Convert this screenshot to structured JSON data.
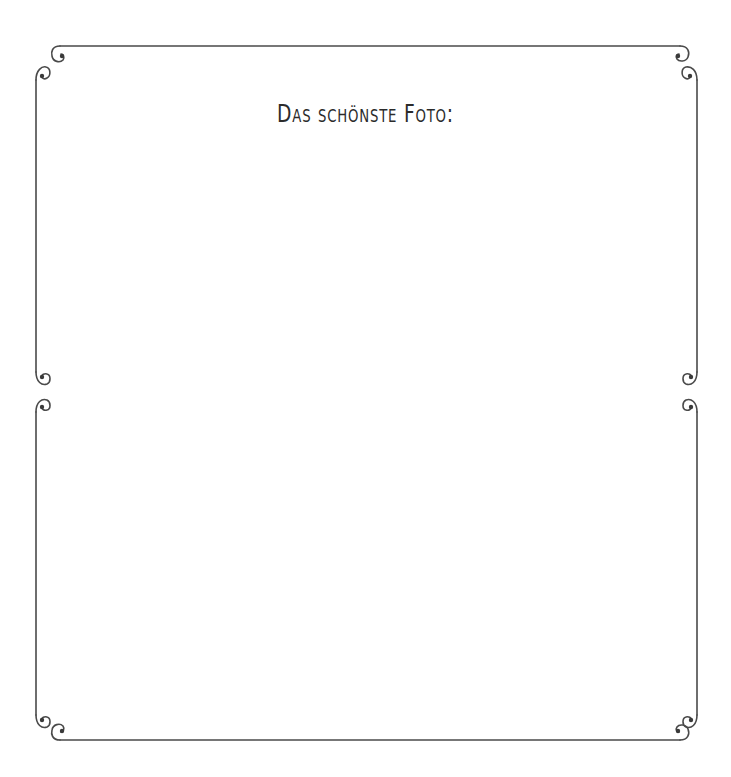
{
  "page": {
    "title": "Das schönste Foto:",
    "colors": {
      "background": "#ffffff",
      "frame_stroke": "#4a4a4a",
      "title_text": "#2b2b2b"
    },
    "frames": [
      {
        "name": "upper-frame",
        "content": ""
      },
      {
        "name": "lower-frame",
        "content": ""
      }
    ],
    "ornaments": [
      "swirl-corner-icon"
    ]
  }
}
